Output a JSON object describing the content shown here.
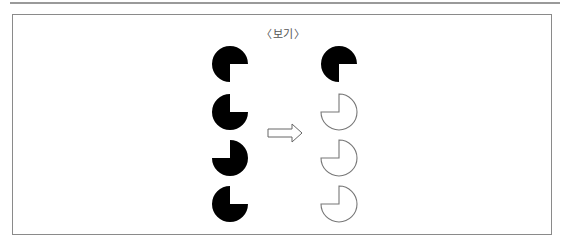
{
  "title": "〈보기〉",
  "colors": {
    "fill": "#000000",
    "outline": "#777777",
    "frame": "#8a8a8a",
    "arrow": "#666666"
  },
  "diagram": {
    "left_column": [
      {
        "missing_quadrant": "bottom-right",
        "style": "filled"
      },
      {
        "missing_quadrant": "top-right",
        "style": "filled"
      },
      {
        "missing_quadrant": "top-left",
        "style": "filled"
      },
      {
        "missing_quadrant": "top-right",
        "style": "filled"
      }
    ],
    "arrow": "right",
    "right_column": [
      {
        "missing_quadrant": "bottom-right",
        "style": "filled"
      },
      {
        "missing_quadrant": "top-left",
        "style": "outline"
      },
      {
        "missing_quadrant": "top-left",
        "style": "outline"
      },
      {
        "missing_quadrant": "top-left",
        "style": "outline"
      }
    ]
  }
}
